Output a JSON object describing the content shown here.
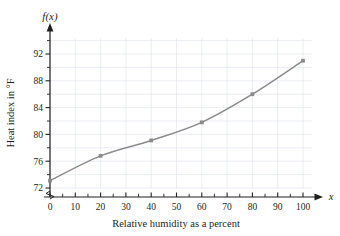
{
  "chart_data": {
    "type": "line",
    "title": "",
    "subtitle": "",
    "xlabel": "Relative humidity as a percent",
    "ylabel": "Heat index in °F",
    "x_axis_variable": "x",
    "y_axis_variable": "f(x)",
    "x": [
      0,
      20,
      40,
      60,
      80,
      100
    ],
    "values": [
      73.1,
      76.8,
      79.1,
      81.8,
      86.0,
      91.0
    ],
    "series": [
      {
        "name": "Heat index",
        "x": [
          0,
          20,
          40,
          60,
          80,
          100
        ],
        "values": [
          73.1,
          76.8,
          79.1,
          81.8,
          86.0,
          91.0
        ]
      }
    ],
    "xlim": [
      0,
      105
    ],
    "ylim": [
      71.2,
      93.2
    ],
    "x_major_ticks": [
      0,
      10,
      20,
      30,
      40,
      50,
      60,
      70,
      80,
      90,
      100
    ],
    "x_tick_labels": [
      "0",
      "10",
      "20",
      "30",
      "40",
      "50",
      "60",
      "70",
      "80",
      "90",
      "100"
    ],
    "x_minor_tick_step": 5,
    "y_major_ticks": [
      72,
      76,
      80,
      84,
      88,
      92
    ],
    "y_tick_labels": [
      "72",
      "76",
      "80",
      "84",
      "88",
      "92"
    ],
    "y_minor_tick_step": 2,
    "grid": true,
    "grid_color": "#d8dde6",
    "legend": "none",
    "line_color": "#8b8b8b",
    "marker_color": "#8b8b8b",
    "marker": "square",
    "axis_color": "#231f20",
    "y_axis_break": true,
    "x_arrow": true,
    "y_arrow": true
  },
  "figure": {
    "background": "#ffffff"
  }
}
